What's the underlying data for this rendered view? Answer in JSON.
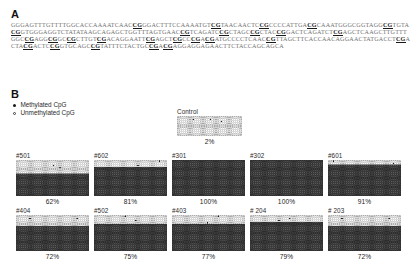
{
  "figure": {
    "panel_a_letter": "A",
    "panel_b_letter": "B"
  },
  "panel_a": {
    "sequence_segments": [
      {
        "t": "GGGAGTTTGTTTTGGCACCAAAATCAAC",
        "cpg": false
      },
      {
        "t": "CG",
        "cpg": true
      },
      {
        "t": "GGACTTTCCAAAATGT",
        "cpg": false
      },
      {
        "t": "CG",
        "cpg": true
      },
      {
        "t": "TAACAACTC",
        "cpg": false
      },
      {
        "t": "CG",
        "cpg": true
      },
      {
        "t": "CCCCATTGA",
        "cpg": false
      },
      {
        "t": "CG",
        "cpg": true
      },
      {
        "t": "CAAATGGGC",
        "cpg": false
      },
      {
        "t": "GGTAGG",
        "cpg": false
      },
      {
        "t": "CG",
        "cpg": true
      },
      {
        "t": "TGTA",
        "cpg": false
      },
      {
        "t": "CG",
        "cpg": true
      },
      {
        "t": "GTGGGAGGTCTATATAAGCAGAGCTGGTTTAGTGAAC",
        "cpg": false
      },
      {
        "t": "CG",
        "cpg": true
      },
      {
        "t": "TCAGATC",
        "cpg": false
      },
      {
        "t": "CG",
        "cpg": true
      },
      {
        "t": "CTAGC",
        "cpg": false
      },
      {
        "t": "CG",
        "cpg": true
      },
      {
        "t": "CTAC",
        "cpg": false
      },
      {
        "t": "CG",
        "cpg": true
      },
      {
        "t": "GACTCAGATCT",
        "cpg": false
      },
      {
        "t": "CG",
        "cpg": true
      },
      {
        "t": "AGCTCAAGCTTGTTTGGC",
        "cpg": false
      },
      {
        "t": "CG",
        "cpg": true
      },
      {
        "t": "AGG",
        "cpg": false
      },
      {
        "t": "CG",
        "cpg": true
      },
      {
        "t": "GC",
        "cpg": false
      },
      {
        "t": "CG",
        "cpg": true
      },
      {
        "t": "CTTGT",
        "cpg": false
      },
      {
        "t": "CG",
        "cpg": true
      },
      {
        "t": "ACAGGAATT",
        "cpg": false
      },
      {
        "t": "CG",
        "cpg": true
      },
      {
        "t": "AGCT",
        "cpg": false
      },
      {
        "t": "CG",
        "cpg": true
      },
      {
        "t": "CC",
        "cpg": false
      },
      {
        "t": "CG",
        "cpg": true
      },
      {
        "t": "A",
        "cpg": false
      },
      {
        "t": "CG",
        "cpg": true
      },
      {
        "t": "ATGCCCCTCAAC",
        "cpg": false
      },
      {
        "t": "CG",
        "cpg": true
      },
      {
        "t": "TTAGCTTCACCAACAGGAACTATGACCT",
        "cpg": false
      },
      {
        "t": "CG",
        "cpg": true
      },
      {
        "t": "ACTA",
        "cpg": false
      },
      {
        "t": "CG",
        "cpg": true
      },
      {
        "t": "ACTC",
        "cpg": false
      },
      {
        "t": "CG",
        "cpg": true
      },
      {
        "t": "GTGCAGC",
        "cpg": false
      },
      {
        "t": "CG",
        "cpg": true
      },
      {
        "t": "TATTTCTACTGC",
        "cpg": false
      },
      {
        "t": "CG",
        "cpg": true
      },
      {
        "t": "A",
        "cpg": false
      },
      {
        "t": "CG",
        "cpg": true
      },
      {
        "t": "AGGAGGAGAACTTCTACCAGCAGCA",
        "cpg": false
      }
    ]
  },
  "legend": {
    "methylated_label": "Methylated CpG",
    "unmethylated_label": "Unmethylated CpG",
    "methylated_marker": "filled-circle",
    "unmethylated_marker": "open-circle"
  },
  "chart_data": {
    "type": "heatmap",
    "marker_legend": {
      "filled": "Methylated CpG",
      "open": "Unmethylated CpG"
    },
    "panels": [
      {
        "id": "control",
        "label": "Control",
        "percent": "2%",
        "percent_value": 2,
        "rows": 9,
        "cols": 30,
        "methylated_fraction": 0.02,
        "filled_band_rows": 0
      },
      {
        "id": "sample-501",
        "label": "#501",
        "percent": "62%",
        "percent_value": 62,
        "rows": 16,
        "cols": 34,
        "methylated_fraction": 0.62,
        "filled_band_rows": 10
      },
      {
        "id": "sample-602",
        "label": "#602",
        "percent": "81%",
        "percent_value": 81,
        "rows": 16,
        "cols": 34,
        "methylated_fraction": 0.81,
        "filled_band_rows": 13
      },
      {
        "id": "sample-301",
        "label": "#301",
        "percent": "100%",
        "percent_value": 100,
        "rows": 16,
        "cols": 34,
        "methylated_fraction": 1.0,
        "filled_band_rows": 16
      },
      {
        "id": "sample-302",
        "label": "#302",
        "percent": "100%",
        "percent_value": 100,
        "rows": 16,
        "cols": 34,
        "methylated_fraction": 1.0,
        "filled_band_rows": 16
      },
      {
        "id": "sample-601",
        "label": "#601",
        "percent": "91%",
        "percent_value": 91,
        "rows": 16,
        "cols": 34,
        "methylated_fraction": 0.91,
        "filled_band_rows": 14
      },
      {
        "id": "sample-404",
        "label": "#404",
        "percent": "72%",
        "percent_value": 72,
        "rows": 16,
        "cols": 34,
        "methylated_fraction": 0.72,
        "filled_band_rows": 11
      },
      {
        "id": "sample-502",
        "label": "#502",
        "percent": "75%",
        "percent_value": 75,
        "rows": 16,
        "cols": 34,
        "methylated_fraction": 0.75,
        "filled_band_rows": 12
      },
      {
        "id": "sample-403",
        "label": "#403",
        "percent": "77%",
        "percent_value": 77,
        "rows": 16,
        "cols": 34,
        "methylated_fraction": 0.77,
        "filled_band_rows": 12
      },
      {
        "id": "sample-204",
        "label": "# 204",
        "percent": "79%",
        "percent_value": 79,
        "rows": 16,
        "cols": 34,
        "methylated_fraction": 0.79,
        "filled_band_rows": 13
      },
      {
        "id": "sample-203",
        "label": "# 203",
        "percent": "72%",
        "percent_value": 72,
        "rows": 16,
        "cols": 34,
        "methylated_fraction": 0.72,
        "filled_band_rows": 11
      }
    ],
    "colors": {
      "open_circle_bg": "#d9d9d9",
      "filled_band": "#3b3b3b",
      "marker_dark": "#1a1a1a",
      "marker_light": "#ffffff"
    }
  },
  "layout": {
    "panel_positions": {
      "control": {
        "left": 177,
        "top": 108,
        "w": 65,
        "h": 20
      },
      "row1": {
        "top": 152,
        "w": 73,
        "h": 36,
        "lefts": [
          16,
          94,
          172,
          250,
          328
        ]
      },
      "row2": {
        "top": 207,
        "w": 73,
        "h": 36,
        "lefts": [
          16,
          94,
          172,
          250,
          328
        ]
      }
    }
  }
}
